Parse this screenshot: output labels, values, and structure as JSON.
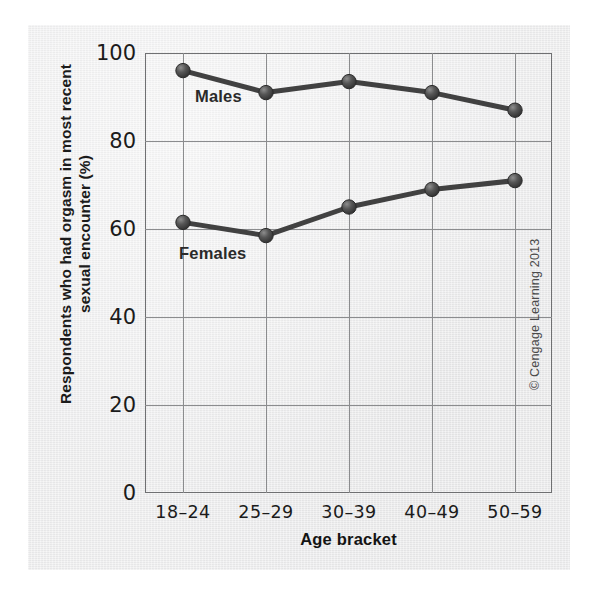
{
  "figure": {
    "y_axis_title_line1": "Respondents who had orgasm in most recent",
    "y_axis_title_line2": "sexual encounter (%)",
    "x_axis_title": "Age bracket",
    "credit": "© Cengage Learning 2013",
    "series_label_males": "Males",
    "series_label_females": "Females",
    "colors": {
      "panel_background": "#ececed",
      "axis_line": "#6f7072",
      "gridline": "#8b8c8e",
      "series_line": "#414141",
      "marker": "#4a4a4a",
      "text": "#1b1b1b"
    }
  },
  "chart_data": {
    "type": "line",
    "title": "",
    "xlabel": "Age bracket",
    "ylabel": "Respondents who had orgasm in most recent sexual encounter (%)",
    "categories": [
      "18–24",
      "25–29",
      "30–39",
      "40–49",
      "50–59"
    ],
    "series": [
      {
        "name": "Males",
        "values": [
          96,
          91,
          93.5,
          91,
          87
        ]
      },
      {
        "name": "Females",
        "values": [
          61.5,
          58.5,
          65,
          69,
          71
        ]
      }
    ],
    "ylim": [
      0,
      100
    ],
    "yticks": [
      0,
      20,
      40,
      60,
      80,
      100
    ],
    "ytick_labels": [
      "0",
      "20",
      "40",
      "60",
      "80",
      "100"
    ],
    "grid": true,
    "legend": "inline-labels",
    "annotations": [
      {
        "text": "Males",
        "series": "Males"
      },
      {
        "text": "Females",
        "series": "Females"
      }
    ]
  }
}
